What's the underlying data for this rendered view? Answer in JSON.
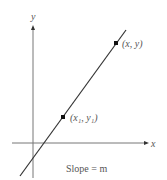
{
  "diagram": {
    "axes": {
      "x_label": "x",
      "y_label": "y"
    },
    "points": [
      {
        "label": "(x₁, y₁)",
        "name": "point-x1-y1"
      },
      {
        "label": "(x, y)",
        "name": "point-x-y"
      }
    ],
    "caption": "Slope = m",
    "colors": {
      "line": "#333333",
      "axis": "#555555",
      "text": "#555555"
    }
  }
}
